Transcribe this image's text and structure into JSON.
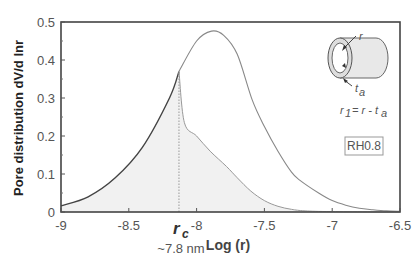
{
  "chart_data": {
    "type": "line",
    "title": "",
    "xlabel": "Log (r)",
    "ylabel": "Pore distribution dV/d lnr",
    "xlim": [
      -9,
      -6.5
    ],
    "ylim": [
      0,
      0.5
    ],
    "xticks": [
      -9,
      -8.5,
      -8,
      -7.5,
      -7,
      -6.5
    ],
    "xtick_labels": [
      "-9",
      "-8.5",
      "-8",
      "-7.5",
      "-7",
      "-6.5"
    ],
    "yticks": [
      0,
      0.1,
      0.2,
      0.3,
      0.4,
      0.5
    ],
    "ytick_labels": [
      "0",
      "0.1",
      "0.2",
      "0.3",
      "0.4",
      "0.5"
    ],
    "grid": false,
    "series": [
      {
        "name": "Full pore size distribution",
        "x": [
          -9.0,
          -8.8,
          -8.6,
          -8.4,
          -8.2,
          -8.13,
          -8.0,
          -7.89,
          -7.8,
          -7.7,
          -7.59,
          -7.5,
          -7.4,
          -7.3,
          -7.24,
          -7.1,
          -7.0,
          -6.9,
          -6.8,
          -6.7,
          -6.6,
          -6.5
        ],
        "y": [
          0.016,
          0.04,
          0.09,
          0.17,
          0.3,
          0.37,
          0.45,
          0.476,
          0.465,
          0.415,
          0.295,
          0.225,
          0.16,
          0.105,
          0.084,
          0.05,
          0.03,
          0.018,
          0.01,
          0.006,
          0.003,
          0.002
        ]
      },
      {
        "name": "Filled-pore (capillary condensed) distribution",
        "x": [
          -8.13,
          -8.09,
          -8.0,
          -7.9,
          -7.78,
          -7.7,
          -7.6,
          -7.5,
          -7.4,
          -7.3,
          -7.2,
          -7.0,
          -6.5
        ],
        "y": [
          0.37,
          0.235,
          0.2,
          0.16,
          0.12,
          0.09,
          0.055,
          0.03,
          0.015,
          0.007,
          0.003,
          0.001,
          0.0
        ]
      }
    ],
    "annotations": {
      "rc_label": "r",
      "rc_sub": "c",
      "rc_x": -8.13,
      "rc_value": "~7.8 nm",
      "inset_r": "r",
      "inset_ta": "t",
      "inset_ta_sub": "a",
      "inset_formula_lhs": "r",
      "inset_formula_lhs_sub": "1",
      "inset_formula_rhs": " = r - t",
      "inset_formula_rhs_sub": "a",
      "condition_badge": "RH0.8"
    },
    "legend": "none"
  }
}
